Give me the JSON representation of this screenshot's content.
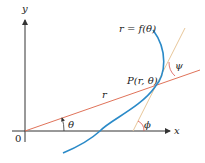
{
  "diagram": {
    "type": "polar-tangent-angle",
    "labels": {
      "y_axis": "y",
      "x_axis": "x",
      "origin": "0",
      "curve": "r = f(θ)",
      "point": "P(r, θ)",
      "radius": "r",
      "theta": "θ",
      "phi": "ϕ",
      "psi": "ψ"
    },
    "colors": {
      "axes": "#333333",
      "radius_line": "#e0735a",
      "curve": "#2a8ac8",
      "tangent_line": "#e8c79a",
      "angle_arcs": "#d9534f",
      "text": "#222222"
    }
  }
}
